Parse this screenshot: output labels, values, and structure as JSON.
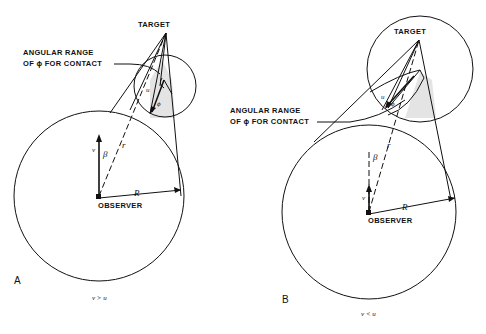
{
  "figure": {
    "panels": [
      {
        "id": "A",
        "panel_label": "A",
        "condition": "v > u",
        "target_label": "TARGET",
        "observer_label": "OBSERVER",
        "angular_range_label_line1": "ANGULAR RANGE",
        "angular_range_label_line2": "OF ϕ FOR CONTACT",
        "symbols": {
          "v": "v",
          "beta": "β",
          "r": "r",
          "R": "R",
          "u": "u",
          "phi": "ϕ"
        }
      },
      {
        "id": "B",
        "panel_label": "B",
        "condition": "v < u",
        "target_label": "TARGET",
        "observer_label": "OBSERVER",
        "angular_range_label_line1": "ANGULAR RANGE",
        "angular_range_label_line2": "OF ϕ FOR CONTACT",
        "symbols": {
          "v": "v",
          "beta": "β",
          "r": "r",
          "R": "R",
          "u": "u",
          "phi": "ϕ"
        }
      }
    ]
  }
}
